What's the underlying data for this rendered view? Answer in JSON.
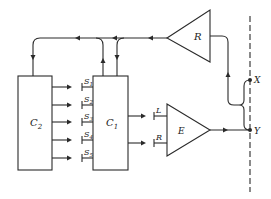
{
  "diagram": {
    "type": "block-diagram",
    "blocks": {
      "c2": {
        "label": "C",
        "sub": "2"
      },
      "c1": {
        "label": "C",
        "sub": "1"
      },
      "r_amp": {
        "label": "R"
      },
      "e_amp": {
        "label": "E"
      }
    },
    "switches": [
      {
        "label": "S",
        "sub": "1"
      },
      {
        "label": "S",
        "sub": "2"
      },
      {
        "label": "S",
        "sub": "3"
      },
      {
        "label": "S",
        "sub": "4"
      },
      {
        "label": "S",
        "sub": "5"
      }
    ],
    "e_inputs": [
      {
        "label": "L"
      },
      {
        "label": "R"
      }
    ],
    "points": {
      "x": {
        "label": "X"
      },
      "y": {
        "label": "Y"
      }
    }
  }
}
